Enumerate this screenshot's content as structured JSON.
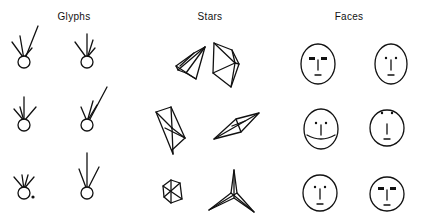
{
  "panels": [
    {
      "title": "Glyphs",
      "x": 74
    },
    {
      "title": "Stars",
      "x": 210
    },
    {
      "title": "Faces",
      "x": 349
    }
  ],
  "layout": {
    "rows": 3,
    "cols_per_panel": 2
  },
  "glyphs": [
    {
      "cx": 24,
      "cy": 62,
      "rays": [
        [
          -12,
          -14
        ],
        [
          -4,
          -20
        ],
        [
          14,
          -30
        ],
        [
          8,
          -8
        ]
      ]
    },
    {
      "cx": 87,
      "cy": 62,
      "rays": [
        [
          -12,
          -14
        ],
        [
          0,
          -22
        ],
        [
          6,
          -16
        ],
        [
          8,
          -8
        ]
      ]
    },
    {
      "cx": 24,
      "cy": 125,
      "rays": [
        [
          -10,
          -10
        ],
        [
          0,
          -22
        ],
        [
          -4,
          -12
        ],
        [
          12,
          -12
        ]
      ]
    },
    {
      "cx": 87,
      "cy": 125,
      "rays": [
        [
          -6,
          -12
        ],
        [
          6,
          -18
        ],
        [
          20,
          -32
        ],
        [
          10,
          -14
        ]
      ]
    },
    {
      "cx": 24,
      "cy": 193,
      "rays": [
        [
          -10,
          -10
        ],
        [
          -2,
          -12
        ],
        [
          4,
          -12
        ],
        [
          10,
          -10
        ]
      ],
      "dot": true
    },
    {
      "cx": 87,
      "cy": 193,
      "rays": [
        [
          -8,
          -18
        ],
        [
          0,
          -34
        ],
        [
          12,
          -20
        ]
      ]
    }
  ],
  "faces": [
    {
      "cx": 318,
      "cy": 64,
      "rx": 17,
      "ry": 20,
      "brows": "heavy",
      "mouth": "flat"
    },
    {
      "cx": 391,
      "cy": 64,
      "rx": 16,
      "ry": 20,
      "brows": "dots",
      "mouth": "flat"
    },
    {
      "cx": 321,
      "cy": 129,
      "rx": 17,
      "ry": 20,
      "brows": "dots",
      "mouth": "smile"
    },
    {
      "cx": 387,
      "cy": 128,
      "rx": 17,
      "ry": 18,
      "brows": "dots-top",
      "mouth": "flat"
    },
    {
      "cx": 320,
      "cy": 193,
      "rx": 17,
      "ry": 18,
      "brows": "dots",
      "mouth": "flat"
    },
    {
      "cx": 387,
      "cy": 194,
      "rx": 17,
      "ry": 17,
      "brows": "heavy",
      "mouth": "flat"
    }
  ]
}
